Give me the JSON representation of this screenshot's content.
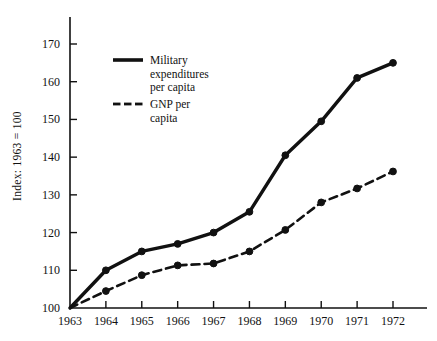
{
  "chart_data": {
    "type": "line",
    "title": "",
    "top_caption_clipped": "",
    "xlabel": "",
    "ylabel": "Index: 1963 = 100",
    "x": [
      1963,
      1964,
      1965,
      1966,
      1967,
      1968,
      1969,
      1970,
      1971,
      1972
    ],
    "xtick_labels": [
      "1963",
      "1964",
      "1965",
      "1966",
      "1967",
      "1968",
      "1969",
      "1970",
      "1971",
      "1972"
    ],
    "ytick_labels": [
      "100",
      "110",
      "120",
      "130",
      "140",
      "150",
      "160",
      "170"
    ],
    "yticks": [
      100,
      110,
      120,
      130,
      140,
      150,
      160,
      170
    ],
    "ylim": [
      100,
      176
    ],
    "xlim": [
      1963,
      1972.6
    ],
    "grid": false,
    "legend_position": "upper-left-inside",
    "series": [
      {
        "name": "Military expenditures per capita",
        "legend_label_lines": [
          "Military",
          "expenditures",
          "per capita"
        ],
        "style": "solid",
        "color": "#111111",
        "marker": "filled-circle",
        "values": [
          100,
          110,
          115,
          117,
          120,
          125.5,
          140.5,
          149.5,
          161,
          165
        ]
      },
      {
        "name": "GNP per capita",
        "legend_label_lines": [
          "GNP per",
          "capita"
        ],
        "style": "dashed",
        "color": "#111111",
        "marker": "filled-circle",
        "values": [
          100,
          104.5,
          108.7,
          111.3,
          111.8,
          115,
          120.7,
          128,
          131.7,
          136.2
        ]
      }
    ]
  },
  "colors": {
    "ink": "#111111",
    "background": "#ffffff"
  }
}
